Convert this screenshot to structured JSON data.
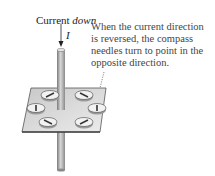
{
  "labels": {
    "current_prefix": "Current ",
    "current_direction": "down",
    "current_symbol": "I"
  },
  "caption": "When the current direction is reversed, the compass needles turn to point in the opposite direction.",
  "colors": {
    "rod": "#a8a8a8",
    "plate": "#d9d9d9",
    "compass_body": "#efefef",
    "needle": "#333333"
  },
  "compasses": [
    {
      "cx": 50,
      "cy": 95
    },
    {
      "cx": 84,
      "cy": 95
    },
    {
      "cx": 36,
      "cy": 108
    },
    {
      "cx": 97,
      "cy": 108
    },
    {
      "cx": 48,
      "cy": 122
    },
    {
      "cx": 84,
      "cy": 122
    }
  ]
}
